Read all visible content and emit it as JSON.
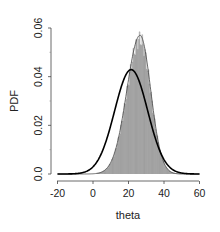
{
  "chart_data": {
    "type": "line",
    "title": "",
    "xlabel": "theta",
    "ylabel": "PDF",
    "xlim": [
      -22,
      61
    ],
    "ylim": [
      0,
      0.06
    ],
    "x_ticks": [
      -20,
      0,
      20,
      40,
      60
    ],
    "x_tick_labels": [
      "-20",
      "0",
      "20",
      "40",
      "60"
    ],
    "y_ticks": [
      0,
      0.02,
      0.04,
      0.06
    ],
    "y_tick_labels": [
      "0.0",
      "0.02",
      "0.04",
      "0.06"
    ],
    "grid": false,
    "legend": null,
    "series": [
      {
        "name": "thick density curve",
        "style": "thick-line",
        "color": "#000000",
        "approx_distribution": {
          "family": "normal",
          "mean": 21.5,
          "sd": 9.3
        },
        "peak": {
          "x": 21.5,
          "y": 0.043
        }
      },
      {
        "name": "thin density curve",
        "style": "thin-line",
        "color": "#555555",
        "approx_distribution": {
          "family": "skew-normal-like",
          "mode": 26.5,
          "sd": 7.0
        },
        "peak": {
          "x": 26.5,
          "y": 0.057
        }
      },
      {
        "name": "histogram",
        "style": "histogram",
        "color": "#9a9a9a",
        "bin_width": 0.5,
        "follows": "thin density curve",
        "range": [
          2,
          50
        ]
      }
    ]
  },
  "axes": {
    "x_label": "theta",
    "y_label": "PDF",
    "x_tick_labels": [
      "-20",
      "0",
      "20",
      "40",
      "60"
    ],
    "y_tick_labels": [
      "0.0",
      "0.02",
      "0.04",
      "0.06"
    ]
  }
}
